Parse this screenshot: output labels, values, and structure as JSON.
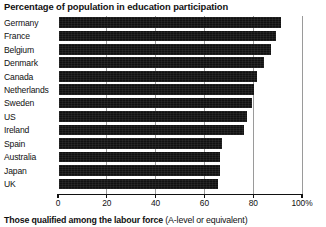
{
  "chart_data": {
    "type": "bar",
    "orientation": "horizontal",
    "title": "Percentage of population in education participation",
    "xlabel": "",
    "ylabel": "",
    "xlim": [
      0,
      100
    ],
    "grid": true,
    "legend": null,
    "categories": [
      "Germany",
      "France",
      "Belgium",
      "Denmark",
      "Canada",
      "Netherlands",
      "Sweden",
      "US",
      "Ireland",
      "Spain",
      "Australia",
      "Japan",
      "UK"
    ],
    "values": [
      91,
      89,
      87,
      84,
      81,
      80,
      79,
      77,
      76,
      67,
      66,
      66,
      65
    ],
    "tick_values": [
      0,
      20,
      40,
      60,
      80,
      100
    ],
    "tick_labels": [
      "0",
      "20",
      "40",
      "60",
      "80",
      "100%"
    ]
  },
  "caption": {
    "strong": "Those qualified among the labour force",
    "light": "(A-level or equivalent)"
  }
}
